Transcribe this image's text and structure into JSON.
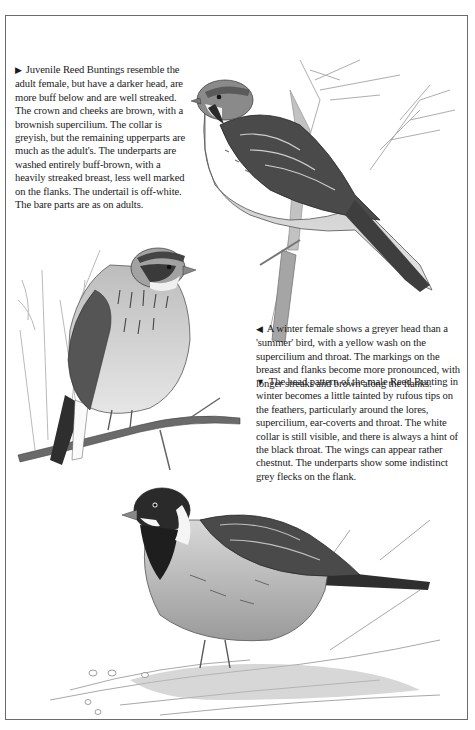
{
  "page": {
    "background": "#ffffff",
    "frame_color": "#6a6a6a"
  },
  "captions": {
    "juvenile": {
      "arrow": "▶",
      "arrow_icon": "triangle-right-icon",
      "text": "Juvenile Reed Buntings resemble the adult female, but have a darker head, are more buff below and are well streaked. The crown and cheeks are brown, with a brownish supercilium. The collar is greyish, but the remaining upperparts are much as the adult's. The underparts are washed entirely buff-brown, with a heavily streaked breast, less well marked on the flanks. The undertail is off-white. The bare parts are as on adults."
    },
    "winter_female": {
      "arrow": "◀",
      "arrow_icon": "triangle-left-icon",
      "text": "A winter female shows a greyer head than a 'summer' bird, with a yellow wash on the supercilium and throat. The markings on the breast and flanks become more pronounced, with longer streaks and brown along the flanks."
    },
    "winter_male": {
      "arrow": "▼",
      "arrow_icon": "triangle-down-icon",
      "text": "The head pattern of the male Reed Bunting in winter becomes a little tainted by rufous tips on the feathers, particularly around the lores, supercilium, ear-coverts and throat. The white collar is still visible, and there is always a hint of the black throat. The wings can appear rather chestnut. The underparts show some indistinct grey flecks on the flank."
    }
  },
  "illustrations": [
    {
      "id": "juvenile",
      "subject": "juvenile reed bunting perched on reed stem",
      "position": "top-right"
    },
    {
      "id": "winter_female",
      "subject": "winter female reed bunting perched on branch",
      "position": "middle-left"
    },
    {
      "id": "winter_male",
      "subject": "winter male reed bunting on ground",
      "position": "bottom"
    }
  ]
}
